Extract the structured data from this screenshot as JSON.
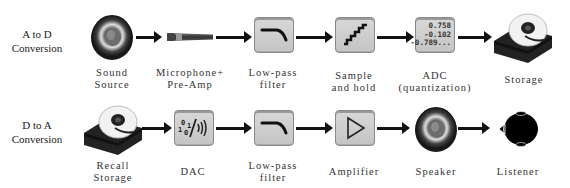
{
  "rows": [
    {
      "label": "A to D\nConversion",
      "label_lines": [
        "A to D",
        "Conversion"
      ],
      "steps": [
        {
          "id": "sound-source",
          "icon": "speaker-icon",
          "caption_lines": [
            "Sound",
            "Source"
          ]
        },
        {
          "id": "microphone",
          "icon": "microphone-icon",
          "caption_lines": [
            "Microphone+",
            "Pre-Amp"
          ]
        },
        {
          "id": "low-pass-filter",
          "icon": "low-pass-filter-icon",
          "caption_lines": [
            "Low-pass",
            "filter"
          ]
        },
        {
          "id": "sample-and-hold",
          "icon": "staircase-icon",
          "caption_lines": [
            "Sample",
            "and hold"
          ]
        },
        {
          "id": "adc",
          "icon": "numbers-icon",
          "caption_lines": [
            "ADC",
            "(quantization)"
          ],
          "values": [
            "0.758",
            "-0.102",
            "-0.789..."
          ]
        },
        {
          "id": "storage",
          "icon": "hard-drive-icon",
          "caption_lines": [
            "Storage"
          ]
        }
      ]
    },
    {
      "label_lines": [
        "D to A",
        "Conversion"
      ],
      "steps": [
        {
          "id": "recall-storage",
          "icon": "hard-drive-icon",
          "caption_lines": [
            "Recall",
            "Storage"
          ]
        },
        {
          "id": "dac",
          "icon": "binary-to-sound-icon",
          "caption_lines": [
            "DAC"
          ],
          "glyph": {
            "digits_top": "0 1",
            "digits_bottom": "1 0"
          }
        },
        {
          "id": "low-pass-filter-2",
          "icon": "low-pass-filter-icon",
          "caption_lines": [
            "Low-pass",
            "filter"
          ]
        },
        {
          "id": "amplifier",
          "icon": "amplifier-triangle-icon",
          "caption_lines": [
            "Amplifier"
          ]
        },
        {
          "id": "speaker",
          "icon": "speaker-icon",
          "caption_lines": [
            "Speaker"
          ]
        },
        {
          "id": "listener",
          "icon": "head-icon",
          "caption_lines": [
            "Listener"
          ]
        }
      ]
    }
  ],
  "colors": {
    "box_fill": "#cdcdcd",
    "box_border": "#8a8a8a",
    "arrow": "#111111",
    "text": "#333333"
  }
}
